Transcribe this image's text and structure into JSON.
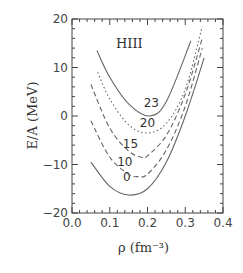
{
  "chart_data": {
    "type": "line",
    "title": "",
    "annotation": "HIII",
    "xlabel": "ρ (fm⁻³)",
    "ylabel": "E/A (MeV)",
    "xlim": [
      0.0,
      0.4
    ],
    "ylim": [
      -20,
      20
    ],
    "xticks": [
      "0.0",
      "0.1",
      "0.2",
      "0.3",
      "0.4"
    ],
    "yticks": [
      "-20",
      "-10",
      "0",
      "10",
      "20"
    ],
    "grid": false,
    "series": [
      {
        "name": "0",
        "style": "solid",
        "x": [
          0.05,
          0.1,
          0.15,
          0.2,
          0.25,
          0.3,
          0.35
        ],
        "y": [
          -9.5,
          -14.5,
          -16.3,
          -15,
          -9.5,
          0,
          12
        ]
      },
      {
        "name": "10",
        "style": "dashed",
        "x": [
          0.05,
          0.1,
          0.15,
          0.175,
          0.2,
          0.25,
          0.3,
          0.345
        ],
        "y": [
          -1,
          -8.5,
          -12,
          -12.5,
          -12,
          -7,
          2,
          14
        ]
      },
      {
        "name": "15",
        "style": "dashed",
        "x": [
          0.05,
          0.1,
          0.15,
          0.185,
          0.2,
          0.25,
          0.3,
          0.345
        ],
        "y": [
          6.5,
          -2.5,
          -7.2,
          -8.5,
          -8.2,
          -4,
          4.5,
          16
        ]
      },
      {
        "name": "20",
        "style": "dotted",
        "x": [
          0.068,
          0.1,
          0.15,
          0.2,
          0.25,
          0.3,
          0.345
        ],
        "y": [
          9,
          3.5,
          -1.8,
          -3.5,
          -1.5,
          5.5,
          18.5
        ]
      },
      {
        "name": "23",
        "style": "solid",
        "x": [
          0.066,
          0.1,
          0.15,
          0.205,
          0.25,
          0.315
        ],
        "y": [
          13.5,
          8,
          2.5,
          0,
          3,
          15.5
        ]
      }
    ]
  }
}
